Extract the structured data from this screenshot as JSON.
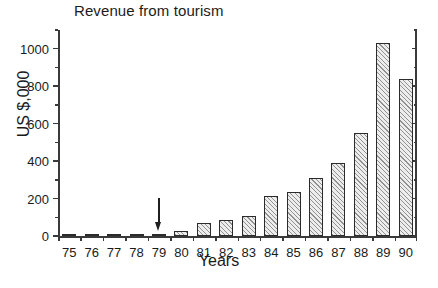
{
  "chart_data": {
    "type": "bar",
    "title": "Revenue from tourism",
    "xlabel": "Years",
    "ylabel": "US $,000",
    "categories": [
      "75",
      "76",
      "77",
      "78",
      "79",
      "80",
      "81",
      "82",
      "83",
      "84",
      "85",
      "86",
      "87",
      "88",
      "89",
      "90"
    ],
    "values": [
      2,
      2,
      4,
      7,
      10,
      27,
      68,
      88,
      107,
      212,
      237,
      312,
      392,
      548,
      1030,
      840
    ],
    "ylim": [
      0,
      1100
    ],
    "ytick_labels": [
      "0",
      "200",
      "400",
      "600",
      "800",
      "1000"
    ],
    "ytick_values": [
      0,
      200,
      400,
      600,
      800,
      1000
    ],
    "yminor_values": [
      100,
      300,
      500,
      700,
      900,
      1100
    ],
    "grid": false,
    "legend": null,
    "annotations": [
      {
        "type": "arrow",
        "direction": "down",
        "target_category": "79",
        "label": ""
      }
    ],
    "series": [
      {
        "name": "Revenue from tourism",
        "values": [
          2,
          2,
          4,
          7,
          10,
          27,
          68,
          88,
          107,
          212,
          237,
          312,
          392,
          548,
          1030,
          840
        ]
      }
    ],
    "style": {
      "bar_fill": "#ededed",
      "bar_hatch": "diagonal",
      "bar_edge": "#2b2b2b",
      "axis_color": "#3a3a3a",
      "text_color": "#1c1c1c",
      "background": "#ffffff"
    }
  }
}
